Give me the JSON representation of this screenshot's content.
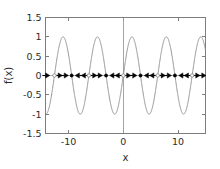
{
  "chart_data": {
    "type": "line",
    "title": "",
    "xlabel": "x",
    "ylabel": "f(x)",
    "xlim": [
      -14.2,
      15.0
    ],
    "ylim": [
      -1.5,
      1.5
    ],
    "grid": false,
    "legend": null,
    "x_ticks": [
      -10,
      0,
      10
    ],
    "x_tick_labels": [
      "-10",
      "0",
      "10"
    ],
    "y_ticks": [
      -1.5,
      -1,
      -0.5,
      0,
      0.5,
      1,
      1.5
    ],
    "y_tick_labels": [
      "-1.5",
      "-1",
      "-0.5",
      "0",
      "0.5",
      "1",
      "1.5"
    ],
    "series": [
      {
        "name": "f(x) = sin(x)",
        "type": "line",
        "color": "#8c8c8c",
        "function": "sin",
        "amplitude": 1,
        "period": 6.2832,
        "phase": 0,
        "x_start": -14.2,
        "x_end": 15.0,
        "samples": 900
      }
    ],
    "annotations": {
      "phase_line": {
        "y": 0,
        "description": "phase line at f(x)=0 with equilibrium points and flow-direction arrows",
        "equilibria": [
          {
            "x": -12.566,
            "marker": "open",
            "stability": "unstable"
          },
          {
            "x": -9.425,
            "marker": "filled",
            "stability": "stable"
          },
          {
            "x": -6.283,
            "marker": "open",
            "stability": "unstable"
          },
          {
            "x": -3.142,
            "marker": "filled",
            "stability": "stable"
          },
          {
            "x": 0.0,
            "marker": "open",
            "stability": "unstable"
          },
          {
            "x": 3.142,
            "marker": "filled",
            "stability": "stable"
          },
          {
            "x": 6.283,
            "marker": "open",
            "stability": "unstable"
          },
          {
            "x": 9.425,
            "marker": "filled",
            "stability": "stable"
          },
          {
            "x": 12.566,
            "marker": "open",
            "stability": "unstable"
          }
        ],
        "arrows": [
          {
            "x": -13.8,
            "direction": "right"
          },
          {
            "x": -11.5,
            "direction": "right"
          },
          {
            "x": -10.4,
            "direction": "right"
          },
          {
            "x": -8.4,
            "direction": "left"
          },
          {
            "x": -7.3,
            "direction": "left"
          },
          {
            "x": -5.2,
            "direction": "right"
          },
          {
            "x": -4.2,
            "direction": "right"
          },
          {
            "x": -2.1,
            "direction": "left"
          },
          {
            "x": -1.1,
            "direction": "left"
          },
          {
            "x": 1.0,
            "direction": "right"
          },
          {
            "x": 2.1,
            "direction": "right"
          },
          {
            "x": 4.2,
            "direction": "left"
          },
          {
            "x": 5.2,
            "direction": "left"
          },
          {
            "x": 7.3,
            "direction": "right"
          },
          {
            "x": 8.4,
            "direction": "right"
          },
          {
            "x": 10.5,
            "direction": "left"
          },
          {
            "x": 11.5,
            "direction": "left"
          },
          {
            "x": 13.6,
            "direction": "right"
          },
          {
            "x": 14.7,
            "direction": "right"
          }
        ]
      },
      "vertical_axis_line": {
        "x": 0
      }
    },
    "colors": {
      "curve": "#8c8c8c",
      "axis": "#7d7d7d",
      "text": "#2b2b2b",
      "arrow": "#000000",
      "background": "#ffffff"
    }
  },
  "axes": {
    "x_title": "x",
    "y_title": "f(x)"
  }
}
